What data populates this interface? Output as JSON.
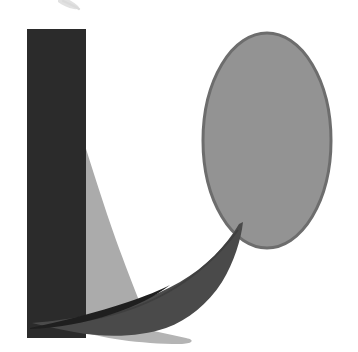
{
  "artwork": {
    "title": "Abstract Sailboat Composition",
    "medium": "Grayscale cut-paper collage",
    "background_color": "#ffffff",
    "canvas": {
      "width": 358,
      "height": 352
    }
  },
  "palette": {
    "background": "#ffffff",
    "near_black": "#2b2b2b",
    "hull_dark_gray": "#4a4a4a",
    "ellipse_gray": "#939393",
    "ellipse_outline": "#6d6d6d",
    "sail_light_gray": "#ababab",
    "water_light_gray": "#b4b4b4",
    "top_mark_gray": "#c9c9c9"
  },
  "shapes": [
    {
      "name": "top-edge-mark",
      "label": "Faint cropped pen mark at top edge",
      "color": "#c9c9c9",
      "kind": "stroke"
    },
    {
      "name": "vertical-bar",
      "label": "Tall dark vertical rectangle (mast / column)",
      "color": "#2b2b2b",
      "kind": "rectangle",
      "bounds": {
        "x": 27,
        "y": 29,
        "width": 59,
        "height": 309
      }
    },
    {
      "name": "sail",
      "label": "Light gray curved sail",
      "color": "#ababab",
      "kind": "curved-triangle",
      "bounds": {
        "x": 60,
        "y": 108,
        "width": 86,
        "height": 214
      }
    },
    {
      "name": "ellipse-sun",
      "label": "Medium gray outlined ellipse (sun / moon)",
      "color": "#939393",
      "outline": "#6d6d6d",
      "kind": "ellipse",
      "bounds": {
        "x": 203,
        "y": 33,
        "width": 128,
        "height": 215
      }
    },
    {
      "name": "water-reflection",
      "label": "Light gray water band under the hull",
      "color": "#b4b4b4",
      "kind": "wedge"
    },
    {
      "name": "boat-hull",
      "label": "Dark gray crescent boat hull with sharp bow",
      "color": "#4a4a4a",
      "kind": "crescent",
      "bounds": {
        "x": 30,
        "y": 222,
        "width": 216,
        "height": 116
      }
    },
    {
      "name": "keel-wedge",
      "label": "Thin dark keel wedge pointing lower-left",
      "color": "#1f1f1f",
      "kind": "sliver"
    }
  ]
}
